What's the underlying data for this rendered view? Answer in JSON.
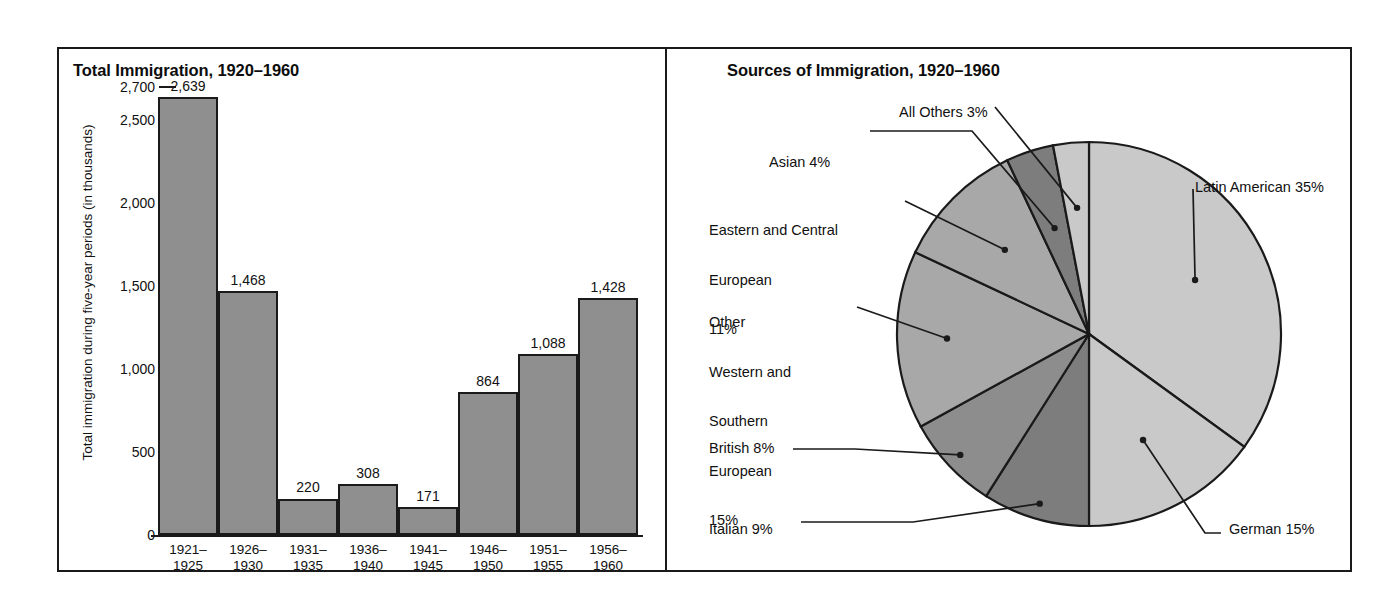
{
  "figure": {
    "bar_panel_title": "Total Immigration, 1920–1960",
    "pie_panel_title": "Sources of Immigration, 1920–1960"
  },
  "colors": {
    "bar_fill": "#8f8f8f",
    "outline": "#1a1a1a",
    "background": "#ffffff",
    "pie_light": "#c9c9c9",
    "pie_medium": "#a8a8a8",
    "pie_dark": "#8d8d8d",
    "pie_darker": "#7d7d7d"
  },
  "chart_data": [
    {
      "type": "bar",
      "title": "Total Immigration, 1920–1960",
      "xlabel": "",
      "ylabel": "Total immigration during five-year periods (in thousands)",
      "categories": [
        "1921–\n1925",
        "1926–\n1930",
        "1931–\n1935",
        "1936–\n1940",
        "1941–\n1945",
        "1946–\n1950",
        "1951–\n1955",
        "1956–\n1960"
      ],
      "category_lines": [
        [
          "1921–",
          "1925"
        ],
        [
          "1926–",
          "1930"
        ],
        [
          "1931–",
          "1935"
        ],
        [
          "1936–",
          "1940"
        ],
        [
          "1941–",
          "1945"
        ],
        [
          "1946–",
          "1950"
        ],
        [
          "1951–",
          "1955"
        ],
        [
          "1956–",
          "1960"
        ]
      ],
      "values": [
        2639,
        1468,
        220,
        308,
        171,
        864,
        1088,
        1428
      ],
      "value_labels": [
        "2,639",
        "1,468",
        "220",
        "308",
        "171",
        "864",
        "1,088",
        "1,428"
      ],
      "ylim": [
        0,
        2700
      ],
      "yticks": [
        0,
        500,
        1000,
        1500,
        2000,
        2500,
        2700
      ],
      "ytick_labels": [
        "0",
        "500",
        "1,000",
        "1,500",
        "2,000",
        "2,500",
        "2,700"
      ],
      "grid": false,
      "legend": "none"
    },
    {
      "type": "pie",
      "title": "Sources of Immigration, 1920–1960",
      "start_angle_deg": 0,
      "direction": "clockwise",
      "legend": "callout-labels",
      "slices": [
        {
          "name": "Latin American",
          "value": 35,
          "label": "Latin American 35%",
          "shade": "pie_light"
        },
        {
          "name": "German",
          "value": 15,
          "label": "German 15%",
          "shade": "pie_light"
        },
        {
          "name": "Italian",
          "value": 9,
          "label": "Italian 9%",
          "shade": "pie_darker"
        },
        {
          "name": "British",
          "value": 8,
          "label": "British 8%",
          "shade": "pie_dark"
        },
        {
          "name": "Other Western and Southern European",
          "value": 15,
          "label": "Other\nWestern and\nSouthern\nEuropean\n15%",
          "shade": "pie_medium"
        },
        {
          "name": "Eastern and Central European",
          "value": 11,
          "label": "Eastern and Central\nEuropean\n11%",
          "shade": "pie_medium"
        },
        {
          "name": "Asian",
          "value": 4,
          "label": "Asian 4%",
          "shade": "pie_darker"
        },
        {
          "name": "All Others",
          "value": 3,
          "label": "All Others 3%",
          "shade": "pie_light"
        }
      ]
    }
  ],
  "pie_labels": {
    "all_others": "All Others 3%",
    "asian": "Asian 4%",
    "eastern_central_l1": "Eastern and Central",
    "eastern_central_l2": "European",
    "eastern_central_l3": "11%",
    "other_wse_l1": "Other",
    "other_wse_l2": "Western and",
    "other_wse_l3": "Southern",
    "other_wse_l4": "European",
    "other_wse_l5": "15%",
    "british": "British 8%",
    "italian": "Italian 9%",
    "latin_american": "Latin American 35%",
    "german": "German 15%"
  }
}
